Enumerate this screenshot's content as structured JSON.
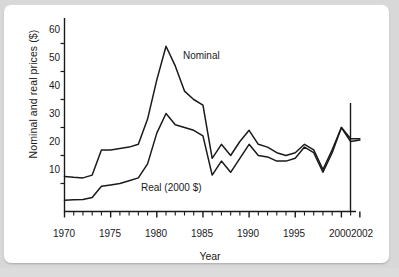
{
  "chart_data": {
    "type": "line",
    "title": "",
    "xlabel": "Year",
    "ylabel": "Nominal and real prices ($)",
    "xlim": [
      1970,
      2002
    ],
    "ylim": [
      0,
      65
    ],
    "yticks": [
      10,
      20,
      30,
      40,
      50,
      60
    ],
    "xticks_labeled": [
      1970,
      1975,
      1980,
      1985,
      1990,
      1995,
      2000,
      2002
    ],
    "xtick_interval_minor": 1,
    "grid": false,
    "legend_position": "inline-annotation",
    "x": [
      1970,
      1971,
      1972,
      1973,
      1974,
      1975,
      1976,
      1977,
      1978,
      1979,
      1980,
      1981,
      1982,
      1983,
      1984,
      1985,
      1986,
      1987,
      1988,
      1989,
      1990,
      1991,
      1992,
      1993,
      1994,
      1995,
      1996,
      1997,
      1998,
      1999,
      2000,
      2001,
      2002
    ],
    "series": [
      {
        "name": "Nominal",
        "color": "#1a1a1a",
        "values": [
          12.5,
          12.2,
          12.0,
          13.0,
          22.0,
          22.0,
          22.5,
          23.0,
          24.0,
          33.0,
          47.0,
          59.0,
          52.0,
          43.0,
          40.0,
          38.0,
          19.0,
          24.0,
          20.0,
          25.0,
          29.0,
          24.0,
          23.0,
          21.0,
          20.0,
          21.0,
          24.0,
          22.0,
          15.0,
          22.0,
          30.0,
          26.0,
          26.0
        ]
      },
      {
        "name": "Real (2000 $)",
        "color": "#1a1a1a",
        "values": [
          4.0,
          4.2,
          4.3,
          5.0,
          9.0,
          9.5,
          10.0,
          11.0,
          12.0,
          17.0,
          28.0,
          35.0,
          31.0,
          30.0,
          29.0,
          27.0,
          13.0,
          18.0,
          14.0,
          19.0,
          24.0,
          20.0,
          19.5,
          18.0,
          18.0,
          19.0,
          23.0,
          21.0,
          14.0,
          21.0,
          30.0,
          25.0,
          25.5
        ]
      }
    ],
    "annotations": [
      {
        "text": "Nominal",
        "name": "series-label-nominal"
      },
      {
        "text": "Real (2000 $)",
        "name": "series-label-real"
      }
    ]
  },
  "axis": {
    "y_tick_labels": [
      "60",
      "50",
      "40",
      "30",
      "20",
      "10"
    ],
    "x_tick_labels": [
      "1970",
      "1975",
      "1980",
      "1985",
      "1990",
      "1995",
      "2000",
      "2002"
    ],
    "y_title": "Nominal and real prices ($)",
    "x_title": "Year"
  }
}
